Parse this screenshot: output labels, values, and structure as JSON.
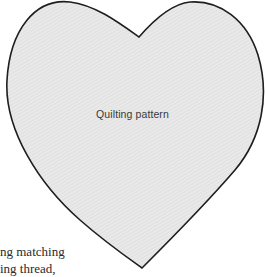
{
  "figure": {
    "label": "Quilting pattern",
    "shape": "heart",
    "colors": {
      "fill": "#e8e8e8",
      "stroke": "#1e1e1e",
      "hatch": "#d6d6d6"
    }
  },
  "body_text": {
    "lines": [
      "ng matching",
      "ing thread,"
    ]
  }
}
